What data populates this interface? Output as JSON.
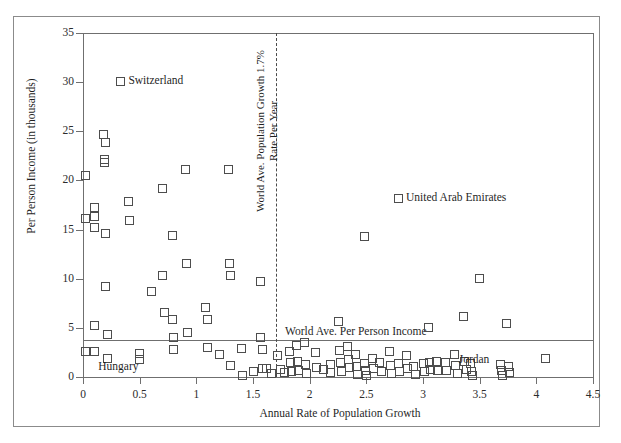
{
  "chart_data": {
    "type": "scatter",
    "title": "",
    "xlabel": "Annual Rate of Population Growth",
    "ylabel": "Per Person Income (in thousands)",
    "xlim": [
      0,
      4.5
    ],
    "ylim": [
      0,
      35
    ],
    "xticks": [
      "0",
      "0.5",
      "1",
      "1.5",
      "2",
      "2.5",
      "3",
      "3.5",
      "4",
      "4.5"
    ],
    "xtick_values": [
      0,
      0.5,
      1,
      1.5,
      2,
      2.5,
      3,
      3.5,
      4,
      4.5
    ],
    "yticks": [
      "0",
      "5",
      "10",
      "15",
      "20",
      "25",
      "30",
      "35"
    ],
    "ytick_values": [
      0,
      5,
      10,
      15,
      20,
      25,
      30,
      35
    ],
    "grid": false,
    "legend": "none",
    "marker": "open-square",
    "marker_color": "#4d4d4d",
    "reference_lines": [
      {
        "name": "world-average-population-growth",
        "orientation": "vertical",
        "value": 1.7,
        "style": "dashed",
        "label": "World Ave. Population Growth 1.7% Rate Per Year",
        "label_line1": "World Ave. Population Growth 1.7%",
        "label_line2": "Rate Per Year"
      },
      {
        "name": "world-average-per-person-income",
        "orientation": "horizontal",
        "value": 3.8,
        "style": "solid",
        "label": "World Ave. Per Person Income"
      }
    ],
    "annotations": [
      {
        "text": "Switzerland",
        "x": 0.33,
        "y": 30.1,
        "swatch": true
      },
      {
        "text": "United Arab Emirates",
        "x": 2.78,
        "y": 18.2,
        "swatch": true
      },
      {
        "text": "Hungary",
        "x": 0.17,
        "y": 1.0,
        "swatch": false
      },
      {
        "text": "Jordan",
        "x": 3.35,
        "y": 1.7,
        "swatch": false
      }
    ],
    "points": [
      [
        0.02,
        20.5
      ],
      [
        0.02,
        16.1
      ],
      [
        0.02,
        2.6
      ],
      [
        0.1,
        17.2
      ],
      [
        0.1,
        16.3
      ],
      [
        0.1,
        15.2
      ],
      [
        0.1,
        5.2
      ],
      [
        0.1,
        2.6
      ],
      [
        0.18,
        24.7
      ],
      [
        0.2,
        23.9
      ],
      [
        0.19,
        22.1
      ],
      [
        0.19,
        21.8
      ],
      [
        0.2,
        14.6
      ],
      [
        0.2,
        9.2
      ],
      [
        0.22,
        4.3
      ],
      [
        0.22,
        1.9
      ],
      [
        0.4,
        17.9
      ],
      [
        0.41,
        15.9
      ],
      [
        0.5,
        2.4
      ],
      [
        0.5,
        1.8
      ],
      [
        0.6,
        8.7
      ],
      [
        0.7,
        19.2
      ],
      [
        0.7,
        10.3
      ],
      [
        0.72,
        6.6
      ],
      [
        0.79,
        14.4
      ],
      [
        0.79,
        5.8
      ],
      [
        0.8,
        4.0
      ],
      [
        0.8,
        2.8
      ],
      [
        0.9,
        21.1
      ],
      [
        0.91,
        11.5
      ],
      [
        0.92,
        4.5
      ],
      [
        1.08,
        7.1
      ],
      [
        1.1,
        5.9
      ],
      [
        1.1,
        3.0
      ],
      [
        1.2,
        2.3
      ],
      [
        1.28,
        21.1
      ],
      [
        1.29,
        11.5
      ],
      [
        1.3,
        10.3
      ],
      [
        1.3,
        1.2
      ],
      [
        1.4,
        2.9
      ],
      [
        1.41,
        0.2
      ],
      [
        1.5,
        0.6
      ],
      [
        1.57,
        9.7
      ],
      [
        1.57,
        4.0
      ],
      [
        1.58,
        2.8
      ],
      [
        1.58,
        0.9
      ],
      [
        1.62,
        0.9
      ],
      [
        1.66,
        0.4
      ],
      [
        1.72,
        2.2
      ],
      [
        1.74,
        0.8
      ],
      [
        1.78,
        0.5
      ],
      [
        1.82,
        2.6
      ],
      [
        1.83,
        1.5
      ],
      [
        1.84,
        0.6
      ],
      [
        1.88,
        3.2
      ],
      [
        1.89,
        1.6
      ],
      [
        1.9,
        0.7
      ],
      [
        1.95,
        3.5
      ],
      [
        1.96,
        1.3
      ],
      [
        1.97,
        0.4
      ],
      [
        2.05,
        2.5
      ],
      [
        2.06,
        1.0
      ],
      [
        2.12,
        0.8
      ],
      [
        2.18,
        1.3
      ],
      [
        2.18,
        0.5
      ],
      [
        2.25,
        5.6
      ],
      [
        2.26,
        2.7
      ],
      [
        2.27,
        1.5
      ],
      [
        2.28,
        0.6
      ],
      [
        2.33,
        3.1
      ],
      [
        2.34,
        1.8
      ],
      [
        2.35,
        1.0
      ],
      [
        2.4,
        2.3
      ],
      [
        2.41,
        1.1
      ],
      [
        2.42,
        0.3
      ],
      [
        2.48,
        14.3
      ],
      [
        2.48,
        1.4
      ],
      [
        2.49,
        0.7
      ],
      [
        2.5,
        0.2
      ],
      [
        2.55,
        1.9
      ],
      [
        2.56,
        0.9
      ],
      [
        2.62,
        1.5
      ],
      [
        2.63,
        0.6
      ],
      [
        2.7,
        2.6
      ],
      [
        2.71,
        1.2
      ],
      [
        2.72,
        0.4
      ],
      [
        2.78,
        1.4
      ],
      [
        2.79,
        0.6
      ],
      [
        2.85,
        2.2
      ],
      [
        2.86,
        0.9
      ],
      [
        2.92,
        1.1
      ],
      [
        2.93,
        0.3
      ],
      [
        3.0,
        1.4
      ],
      [
        3.01,
        0.6
      ],
      [
        3.05,
        5.0
      ],
      [
        3.06,
        1.5
      ],
      [
        3.07,
        0.8
      ],
      [
        3.12,
        1.6
      ],
      [
        3.13,
        0.7
      ],
      [
        3.2,
        1.5
      ],
      [
        3.21,
        0.7
      ],
      [
        3.28,
        2.3
      ],
      [
        3.29,
        1.2
      ],
      [
        3.3,
        0.4
      ],
      [
        3.36,
        6.2
      ],
      [
        3.37,
        1.6
      ],
      [
        3.38,
        0.8
      ],
      [
        3.42,
        1.4
      ],
      [
        3.43,
        0.6
      ],
      [
        3.44,
        0.2
      ],
      [
        3.5,
        10.0
      ],
      [
        3.68,
        1.3
      ],
      [
        3.69,
        0.7
      ],
      [
        3.7,
        0.2
      ],
      [
        3.74,
        5.4
      ],
      [
        3.75,
        1.1
      ],
      [
        3.76,
        0.5
      ],
      [
        4.08,
        1.9
      ]
    ],
    "named_points": [
      {
        "label": "Switzerland",
        "x": 0.22,
        "y": 30.1
      },
      {
        "label": "United Arab Emirates",
        "x": 2.48,
        "y": 18.2
      },
      {
        "label": "Hungary",
        "x": 0.1,
        "y": 2.6
      },
      {
        "label": "Jordan",
        "x": 3.45,
        "y": 1.7
      }
    ]
  },
  "axes": {
    "x_label": "Annual Rate of Population Growth",
    "y_label": "Per Person Income (in thousands)"
  }
}
